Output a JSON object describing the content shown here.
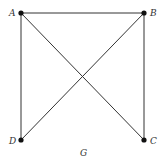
{
  "graph": {
    "name": "G",
    "nodes": [
      {
        "id": "A",
        "label": "A",
        "x": 21,
        "y": 13
      },
      {
        "id": "B",
        "label": "B",
        "x": 144,
        "y": 13
      },
      {
        "id": "C",
        "label": "C",
        "x": 144,
        "y": 140
      },
      {
        "id": "D",
        "label": "D",
        "x": 21,
        "y": 140
      }
    ],
    "edges": [
      [
        "A",
        "B"
      ],
      [
        "A",
        "D"
      ],
      [
        "A",
        "C"
      ],
      [
        "B",
        "D"
      ],
      [
        "B",
        "C"
      ]
    ],
    "colors": {
      "edge": "#333333",
      "node": "#111111"
    }
  }
}
